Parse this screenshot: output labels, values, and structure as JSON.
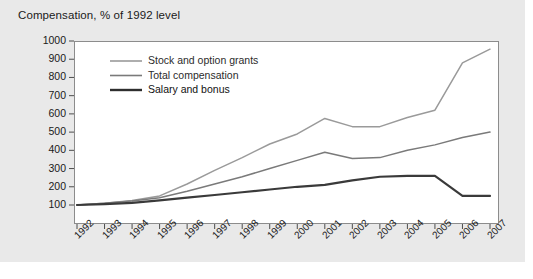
{
  "chart_data": {
    "type": "line",
    "title": "Compensation, % of 1992 level",
    "xlabel": "",
    "ylabel": "",
    "ylim": [
      0,
      1000
    ],
    "yticks": [
      100,
      200,
      300,
      400,
      500,
      600,
      700,
      800,
      900,
      1000
    ],
    "grid": false,
    "legend_position": "upper-left-inside",
    "categories": [
      "1992",
      "1993",
      "1994",
      "1995",
      "1996",
      "1997",
      "1998",
      "1999",
      "2000",
      "2001",
      "2002",
      "2003",
      "2004",
      "2005",
      "2006",
      "2007"
    ],
    "series": [
      {
        "name": "Stock and option grants",
        "color": "#9a9a9a",
        "width": 1.5,
        "values": [
          100,
          110,
          125,
          150,
          215,
          290,
          360,
          435,
          490,
          575,
          530,
          530,
          580,
          620,
          880,
          955
        ]
      },
      {
        "name": "Total compensation",
        "color": "#7a7a7a",
        "width": 1.5,
        "values": [
          100,
          110,
          122,
          140,
          175,
          215,
          255,
          300,
          345,
          390,
          355,
          360,
          400,
          430,
          470,
          500
        ]
      },
      {
        "name": "Salary and bonus",
        "color": "#3a3a3a",
        "width": 2.2,
        "values": [
          100,
          105,
          112,
          125,
          140,
          155,
          170,
          185,
          200,
          210,
          235,
          255,
          260,
          260,
          150,
          150
        ]
      }
    ]
  },
  "legend": {
    "items": [
      {
        "label": "Stock and option grants",
        "color": "#9a9a9a",
        "width": 1.6
      },
      {
        "label": "Total compensation",
        "color": "#7a7a7a",
        "width": 1.6
      },
      {
        "label": "Salary and bonus",
        "color": "#2e2e2e",
        "width": 2.4
      }
    ]
  },
  "axes": {
    "tick_color": "#4d4d4d",
    "frame_color": "#8c8c8c"
  },
  "panel": {
    "background": "#e9e9e9"
  }
}
